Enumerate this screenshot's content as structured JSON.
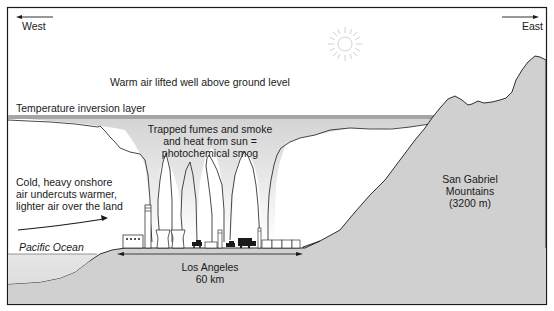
{
  "diagram": {
    "directions": {
      "west": "West",
      "east": "East"
    },
    "labels": {
      "warm_air": "Warm air lifted well above ground level",
      "inversion_layer": "Temperature inversion layer",
      "smog_line1": "Trapped fumes and smoke",
      "smog_line2": "and heat from sun =",
      "smog_line3": "photochemical smog",
      "cold_air_line1": "Cold, heavy onshore",
      "cold_air_line2": "air undercuts warmer,",
      "cold_air_line3": "lighter air over the land",
      "ocean": "Pacific Ocean",
      "city_name": "Los Angeles",
      "city_width": "60 km",
      "mountains_line1": "San Gabriel",
      "mountains_line2": "Mountains",
      "mountains_line3": "(3200 m)"
    },
    "icons": [
      "sun-icon",
      "smokestack-icon",
      "cooling-tower-icon",
      "factory-icon",
      "truck-icon",
      "car-icon",
      "house-icon",
      "wind-arrow-icon"
    ],
    "colors": {
      "ground": "#cfcfcf",
      "smog": "#d9d9d9",
      "inversion_line": "#9a9a9a",
      "ocean": "#e3e3e3",
      "outline": "#1a1a1a"
    }
  }
}
